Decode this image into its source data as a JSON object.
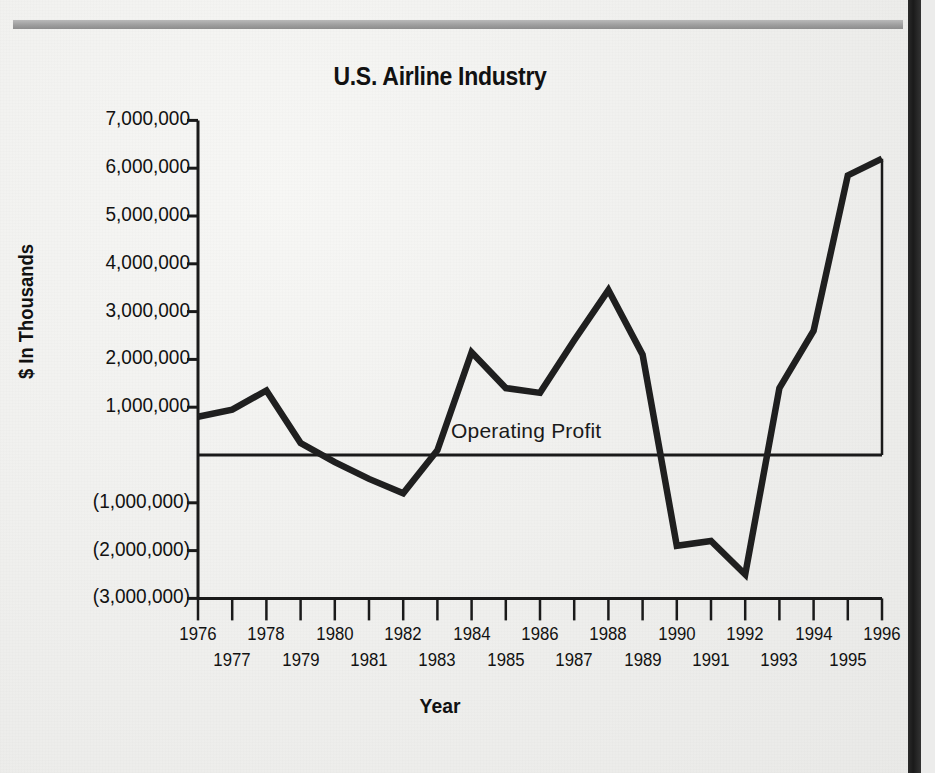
{
  "chart_data": {
    "type": "line",
    "title": "U.S. Airline Industry",
    "xlabel": "Year",
    "ylabel": "$ In Thousands",
    "grid": false,
    "legend_position": "inline-annotation",
    "annotations": [
      {
        "text": "Operating Profit",
        "x": 1983.4,
        "y": 450000
      }
    ],
    "xlim": [
      1976,
      1996
    ],
    "ylim": [
      -3000000,
      7000000
    ],
    "ytick_values": [
      7000000,
      6000000,
      5000000,
      4000000,
      3000000,
      2000000,
      1000000,
      -1000000,
      -2000000,
      -3000000
    ],
    "ytick_labels": [
      "7,000,000",
      "6,000,000",
      "5,000,000",
      "4,000,000",
      "3,000,000",
      "2,000,000",
      "1,000,000",
      "(1,000,000)",
      "(2,000,000)",
      "(3,000,000)"
    ],
    "zero_line": 0,
    "x": [
      1976,
      1977,
      1978,
      1979,
      1980,
      1981,
      1982,
      1983,
      1984,
      1985,
      1986,
      1987,
      1988,
      1989,
      1990,
      1991,
      1992,
      1993,
      1994,
      1995,
      1996
    ],
    "xtick_labels": [
      "1976",
      "1977",
      "1978",
      "1979",
      "1980",
      "1981",
      "1982",
      "1983",
      "1984",
      "1985",
      "1986",
      "1987",
      "1988",
      "1989",
      "1990",
      "1991",
      "1992",
      "1993",
      "1994",
      "1995",
      "1996"
    ],
    "series": [
      {
        "name": "Operating Profit",
        "color": "#1f1f1f",
        "values": [
          800000,
          950000,
          1350000,
          250000,
          -150000,
          -500000,
          -800000,
          100000,
          2150000,
          1400000,
          1300000,
          2400000,
          3450000,
          2100000,
          -1900000,
          -1800000,
          -2500000,
          1400000,
          2600000,
          5850000,
          6200000
        ]
      }
    ]
  },
  "colors": {
    "line": "#1f1f1f",
    "axis": "#1a1a1a",
    "text": "#111111",
    "background": "#efefed",
    "scan_bar": "#9e9e9e",
    "gutter": "#222222"
  }
}
